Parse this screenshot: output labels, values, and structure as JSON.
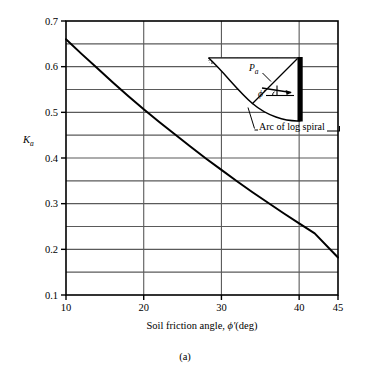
{
  "figure": {
    "caption": "(a)",
    "background_color": "#ffffff",
    "line_color": "#000000",
    "grid_color": "#5a5a5a"
  },
  "axes": {
    "y_label": "K",
    "y_label_sub": "a",
    "x_label_prefix": "Soil friction angle, ",
    "x_label_symbol": "ϕ′",
    "x_label_suffix": "(deg)",
    "y_ticks": [
      "0.7",
      "0.6",
      "0.5",
      "0.4",
      "0.3",
      "0.2",
      "0.1"
    ],
    "x_ticks": [
      "10",
      "20",
      "30",
      "40",
      "45"
    ]
  },
  "inset": {
    "pa_label": "P",
    "pa_sub": "a",
    "phi_label": "ϕ′",
    "arc_note": "Arc of log spiral"
  },
  "chart_data": {
    "type": "line",
    "title": "",
    "xlabel": "Soil friction angle, ϕ′ (deg)",
    "ylabel": "Ka",
    "xlim": [
      10,
      45
    ],
    "ylim": [
      0.1,
      0.7
    ],
    "xticks": [
      10,
      20,
      30,
      40,
      45
    ],
    "yticks": [
      0.1,
      0.2,
      0.3,
      0.4,
      0.5,
      0.6,
      0.7
    ],
    "ygrid_minor": [
      0.15,
      0.25,
      0.35,
      0.45,
      0.55,
      0.65
    ],
    "xgrid": [
      20,
      30,
      40
    ],
    "grid": true,
    "legend": null,
    "series": [
      {
        "name": "Ka (Coulomb / log-spiral active earth pressure coefficient)",
        "x": [
          10,
          12,
          14,
          16,
          18,
          20,
          22,
          24,
          26,
          28,
          30,
          32,
          34,
          36,
          38,
          40,
          42,
          45
        ],
        "values": [
          0.66,
          0.628,
          0.597,
          0.566,
          0.536,
          0.507,
          0.479,
          0.452,
          0.425,
          0.399,
          0.374,
          0.349,
          0.325,
          0.302,
          0.279,
          0.257,
          0.235,
          0.182
        ]
      }
    ],
    "annotations": [
      {
        "text": "Pa",
        "x": 33.5,
        "y": 0.487
      },
      {
        "text": "ϕ′",
        "x": 35.2,
        "y": 0.423
      },
      {
        "text": "Arc of log spiral",
        "x": 37.0,
        "y": 0.333
      }
    ]
  }
}
